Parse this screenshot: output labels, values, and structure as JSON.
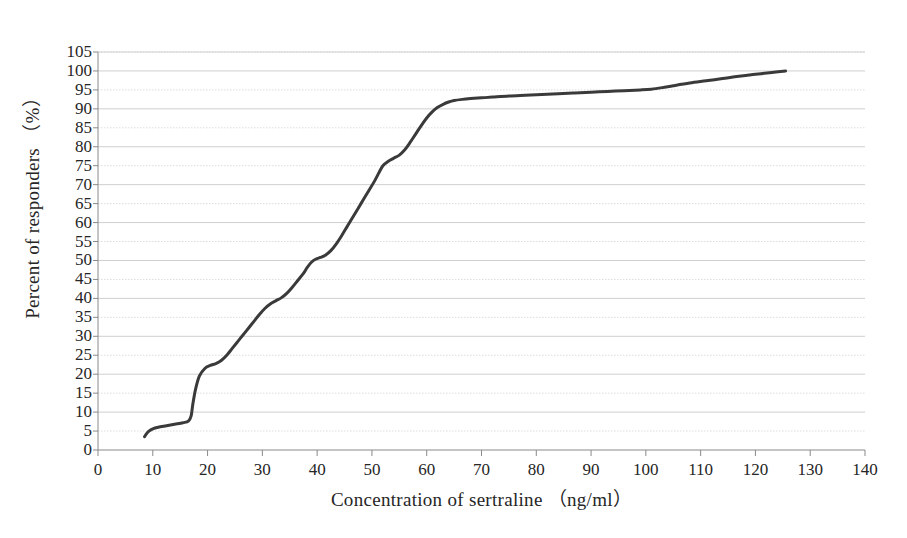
{
  "chart_data": {
    "type": "line",
    "title": "",
    "xlabel": "Concentration of sertraline （ng/ml）",
    "ylabel": "Percent of responders （%）",
    "xlim": [
      0,
      140
    ],
    "ylim": [
      0,
      105
    ],
    "xticks": [
      0,
      10,
      20,
      30,
      40,
      50,
      60,
      70,
      80,
      90,
      100,
      110,
      120,
      130,
      140
    ],
    "yticks": [
      0,
      5,
      10,
      15,
      20,
      25,
      30,
      35,
      40,
      45,
      50,
      55,
      60,
      65,
      70,
      75,
      80,
      85,
      90,
      95,
      100,
      105
    ],
    "grid": "horizontal",
    "legend": "none",
    "line_color": "#3a3a3a",
    "line_width": 3,
    "series": [
      {
        "name": "Cumulative percent of responders",
        "x": [
          8.5,
          8.8,
          9.3,
          10.0,
          11.0,
          12.5,
          14.0,
          15.5,
          16.5,
          17.0,
          17.3,
          17.8,
          18.5,
          19.5,
          20.5,
          21.5,
          22.5,
          23.5,
          24.5,
          25.5,
          26.5,
          27.5,
          28.5,
          29.5,
          30.5,
          31.5,
          32.5,
          33.5,
          34.5,
          35.5,
          36.5,
          37.5,
          38.2,
          39.0,
          39.8,
          40.6,
          41.5,
          42.5,
          43.5,
          44.5,
          45.5,
          46.5,
          47.5,
          48.5,
          49.5,
          50.5,
          51.3,
          52.0,
          53.0,
          54.0,
          55.0,
          56.0,
          57.0,
          58.0,
          59.0,
          60.0,
          61.0,
          62.0,
          63.0,
          64.0,
          65.0,
          66.5,
          68.0,
          70.0,
          72.0,
          75.0,
          78.0,
          81.0,
          84.0,
          87.0,
          90.0,
          93.0,
          96.0,
          99.0,
          101.0,
          103.0,
          105.0,
          108.0,
          111.0,
          114.0,
          117.0,
          120.0,
          123.0,
          125.5
        ],
        "y": [
          3.5,
          4.2,
          5.0,
          5.6,
          6.0,
          6.4,
          6.8,
          7.2,
          7.6,
          9.0,
          12.0,
          16.0,
          19.5,
          21.5,
          22.3,
          22.8,
          23.6,
          25.0,
          26.8,
          28.6,
          30.4,
          32.2,
          34.0,
          35.8,
          37.4,
          38.6,
          39.4,
          40.2,
          41.4,
          43.0,
          44.8,
          46.6,
          48.2,
          49.6,
          50.4,
          50.8,
          51.4,
          52.6,
          54.4,
          56.6,
          59.0,
          61.4,
          63.8,
          66.2,
          68.6,
          71.0,
          73.2,
          75.0,
          76.2,
          77.0,
          77.8,
          79.2,
          81.2,
          83.4,
          85.6,
          87.6,
          89.2,
          90.4,
          91.2,
          91.8,
          92.2,
          92.5,
          92.7,
          92.9,
          93.1,
          93.4,
          93.6,
          93.8,
          94.0,
          94.2,
          94.4,
          94.6,
          94.8,
          95.0,
          95.2,
          95.6,
          96.1,
          96.8,
          97.4,
          98.0,
          98.6,
          99.1,
          99.6,
          100.0
        ]
      }
    ]
  },
  "plot": {
    "left_px": 98,
    "right_px": 865,
    "top_px": 52,
    "bottom_px": 450
  }
}
